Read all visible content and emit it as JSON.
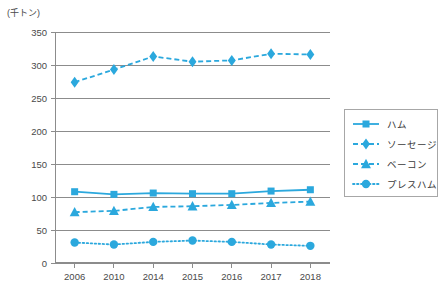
{
  "chart_data": {
    "type": "line",
    "title": "",
    "xlabel": "",
    "ylabel": "",
    "unit_label": "(千トン)",
    "categories": [
      "2006",
      "2010",
      "2014",
      "2015",
      "2016",
      "2017",
      "2018"
    ],
    "ylim": [
      0,
      350
    ],
    "ytick_step": 50,
    "yticks": [
      "0",
      "50",
      "100",
      "150",
      "200",
      "250",
      "300",
      "350"
    ],
    "grid": "horizontal",
    "legend_position": "right",
    "series": [
      {
        "name": "ハム",
        "marker": "square",
        "line_style": "solid",
        "color": "#2BA8DD",
        "values": [
          108,
          104,
          106,
          105,
          105,
          109,
          111
        ]
      },
      {
        "name": "ソーセージ",
        "marker": "diamond",
        "line_style": "dashed",
        "color": "#2BA8DD",
        "values": [
          274,
          293,
          313,
          305,
          307,
          317,
          316
        ]
      },
      {
        "name": "ベーコン",
        "marker": "triangle",
        "line_style": "dashed",
        "color": "#2BA8DD",
        "values": [
          77,
          79,
          85,
          86,
          88,
          91,
          93
        ]
      },
      {
        "name": "プレスハム",
        "marker": "circle",
        "line_style": "dotted",
        "color": "#2BA8DD",
        "values": [
          31,
          28,
          32,
          34,
          32,
          28,
          26
        ]
      }
    ],
    "colors": {
      "series_blue": "#2BA8DD",
      "gridline": "#8c8c8c",
      "axis": "#8c8c8c",
      "text": "#3a3a3a",
      "legend_border": "#a7a7a7",
      "background": "#ffffff"
    }
  },
  "legend": {
    "items": [
      {
        "label": "ハム",
        "marker": "square-marker-icon",
        "line_style": "solid"
      },
      {
        "label": "ソーセージ",
        "marker": "diamond-marker-icon",
        "line_style": "dashed"
      },
      {
        "label": "ベーコン",
        "marker": "triangle-marker-icon",
        "line_style": "dashed"
      },
      {
        "label": "プレスハム",
        "marker": "circle-marker-icon",
        "line_style": "dotted"
      }
    ]
  }
}
